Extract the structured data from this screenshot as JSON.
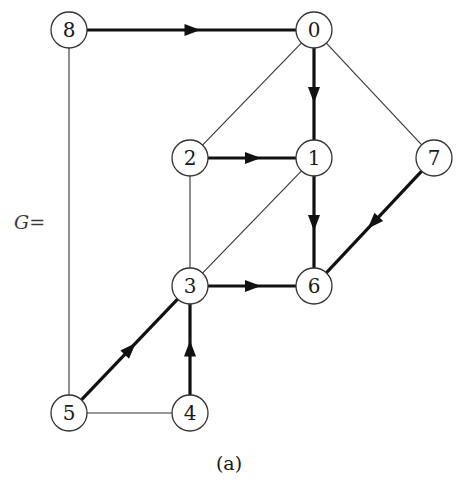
{
  "graph": {
    "name_label": "G=",
    "caption": "(a)",
    "colors": {
      "edge": "#111111",
      "thin_edge": "#333333",
      "node_fill": "#ffffff",
      "node_stroke": "#333333"
    },
    "nodes": [
      {
        "id": "8",
        "label": "8",
        "x": 69,
        "y": 30
      },
      {
        "id": "0",
        "label": "0",
        "x": 314,
        "y": 30
      },
      {
        "id": "2",
        "label": "2",
        "x": 190,
        "y": 158
      },
      {
        "id": "1",
        "label": "1",
        "x": 314,
        "y": 158
      },
      {
        "id": "7",
        "label": "7",
        "x": 434,
        "y": 158
      },
      {
        "id": "3",
        "label": "3",
        "x": 190,
        "y": 286
      },
      {
        "id": "6",
        "label": "6",
        "x": 314,
        "y": 286
      },
      {
        "id": "5",
        "label": "5",
        "x": 69,
        "y": 413
      },
      {
        "id": "4",
        "label": "4",
        "x": 190,
        "y": 413
      }
    ],
    "edges": [
      {
        "from": "8",
        "to": "0",
        "directed": true
      },
      {
        "from": "0",
        "to": "1",
        "directed": true
      },
      {
        "from": "2",
        "to": "1",
        "directed": true
      },
      {
        "from": "1",
        "to": "6",
        "directed": true
      },
      {
        "from": "7",
        "to": "6",
        "directed": true
      },
      {
        "from": "3",
        "to": "6",
        "directed": true
      },
      {
        "from": "5",
        "to": "3",
        "directed": true
      },
      {
        "from": "4",
        "to": "3",
        "directed": true
      },
      {
        "from": "8",
        "to": "5",
        "directed": false
      },
      {
        "from": "0",
        "to": "2",
        "directed": false
      },
      {
        "from": "0",
        "to": "7",
        "directed": false
      },
      {
        "from": "2",
        "to": "3",
        "directed": false
      },
      {
        "from": "1",
        "to": "3",
        "directed": false
      },
      {
        "from": "5",
        "to": "4",
        "directed": false
      }
    ]
  }
}
